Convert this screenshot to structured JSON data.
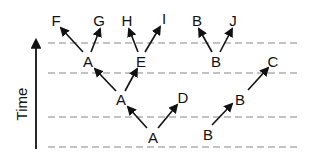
{
  "diagram": {
    "axis_label": "Time",
    "time_levels": [
      43,
      73,
      117,
      147
    ],
    "nodes": [
      {
        "id": "n_A0",
        "label": "A",
        "x": 153,
        "y": 137
      },
      {
        "id": "n_B0",
        "label": "B",
        "x": 208,
        "y": 134
      },
      {
        "id": "n_A1",
        "label": "A",
        "x": 121,
        "y": 99
      },
      {
        "id": "n_D",
        "label": "D",
        "x": 183,
        "y": 97
      },
      {
        "id": "n_B1",
        "label": "B",
        "x": 241,
        "y": 98
      },
      {
        "id": "n_C",
        "label": "C",
        "x": 244,
        "y": 92
      },
      {
        "id": "n_A2",
        "label": "A",
        "x": 88,
        "y": 61
      },
      {
        "id": "n_E",
        "label": "E",
        "x": 141,
        "y": 61
      },
      {
        "id": "n_B2",
        "label": "B",
        "x": 216,
        "y": 61
      },
      {
        "id": "n_F",
        "label": "F",
        "x": 56,
        "y": 20
      },
      {
        "id": "n_G",
        "label": "G",
        "x": 99,
        "y": 20
      },
      {
        "id": "n_H",
        "label": "H",
        "x": 127,
        "y": 20
      },
      {
        "id": "n_I",
        "label": "I",
        "x": 164,
        "y": 18
      },
      {
        "id": "n_B3",
        "label": "B",
        "x": 197,
        "y": 20
      },
      {
        "id": "n_J",
        "label": "J",
        "x": 233,
        "y": 20
      }
    ],
    "edges": [
      {
        "from": "A",
        "to": "A",
        "x1": 147,
        "y1": 128,
        "x2": 128,
        "y2": 107
      },
      {
        "from": "A",
        "to": "D",
        "x1": 158,
        "y1": 128,
        "x2": 177,
        "y2": 105
      },
      {
        "from": "B",
        "to": "B",
        "x1": 212,
        "y1": 125,
        "x2": 232,
        "y2": 104
      },
      {
        "from": "B",
        "to": "C",
        "x1": 248,
        "y1": 90,
        "x2": 268,
        "y2": 68
      },
      {
        "from": "A",
        "to": "A",
        "x1": 116,
        "y1": 91,
        "x2": 95,
        "y2": 69
      },
      {
        "from": "A",
        "to": "E",
        "x1": 125,
        "y1": 91,
        "x2": 137,
        "y2": 69
      },
      {
        "from": "A",
        "to": "F",
        "x1": 83,
        "y1": 52,
        "x2": 61,
        "y2": 28
      },
      {
        "from": "A",
        "to": "G",
        "x1": 91,
        "y1": 52,
        "x2": 100,
        "y2": 29
      },
      {
        "from": "E",
        "to": "H",
        "x1": 138,
        "y1": 52,
        "x2": 129,
        "y2": 29
      },
      {
        "from": "E",
        "to": "I",
        "x1": 145,
        "y1": 52,
        "x2": 160,
        "y2": 27
      },
      {
        "from": "B",
        "to": "B",
        "x1": 212,
        "y1": 52,
        "x2": 199,
        "y2": 29
      },
      {
        "from": "B",
        "to": "J",
        "x1": 220,
        "y1": 52,
        "x2": 232,
        "y2": 29
      }
    ]
  }
}
